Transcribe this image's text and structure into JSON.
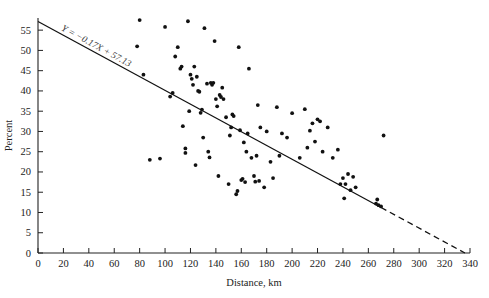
{
  "chart_data": {
    "type": "scatter",
    "title": "",
    "xlabel": "Distance, km",
    "ylabel": "Percent",
    "xlim": [
      0,
      340
    ],
    "ylim": [
      0,
      58
    ],
    "grid": false,
    "legend": null,
    "xticks": [
      0,
      20,
      40,
      60,
      80,
      100,
      120,
      140,
      160,
      180,
      200,
      220,
      240,
      260,
      280,
      300,
      320,
      340
    ],
    "yticks": [
      0,
      5,
      10,
      15,
      20,
      25,
      30,
      35,
      40,
      45,
      50,
      55
    ],
    "annotation": "Y = −0.17X + 57.13",
    "fit_line": {
      "slope": -0.17,
      "intercept": 57.13,
      "solid_range": [
        0,
        270
      ],
      "dashed_range": [
        270,
        336
      ]
    },
    "points": [
      [
        78,
        51.0
      ],
      [
        80,
        57.5
      ],
      [
        83,
        44.0
      ],
      [
        88,
        23.0
      ],
      [
        96,
        23.3
      ],
      [
        100,
        55.8
      ],
      [
        104,
        38.6
      ],
      [
        106,
        39.5
      ],
      [
        108,
        48.5
      ],
      [
        110,
        50.8
      ],
      [
        112,
        45.5
      ],
      [
        113,
        46.0
      ],
      [
        114,
        31.3
      ],
      [
        116,
        25.8
      ],
      [
        116,
        24.7
      ],
      [
        118,
        57.2
      ],
      [
        119,
        35.0
      ],
      [
        120,
        44.0
      ],
      [
        121,
        43.0
      ],
      [
        122,
        41.5
      ],
      [
        123,
        46.0
      ],
      [
        124,
        21.7
      ],
      [
        125,
        43.5
      ],
      [
        126,
        40.0
      ],
      [
        127,
        39.8
      ],
      [
        128,
        34.6
      ],
      [
        129,
        35.4
      ],
      [
        130,
        28.5
      ],
      [
        131,
        55.5
      ],
      [
        133,
        41.8
      ],
      [
        134,
        25.0
      ],
      [
        135,
        23.6
      ],
      [
        136,
        42.0
      ],
      [
        137,
        41.5
      ],
      [
        138,
        42.0
      ],
      [
        139,
        52.3
      ],
      [
        140,
        38.0
      ],
      [
        141,
        36.2
      ],
      [
        142,
        19.0
      ],
      [
        143,
        39.0
      ],
      [
        144,
        38.5
      ],
      [
        145,
        40.8
      ],
      [
        146,
        38.0
      ],
      [
        148,
        33.5
      ],
      [
        150,
        17.0
      ],
      [
        151,
        29.0
      ],
      [
        152,
        31.0
      ],
      [
        153,
        34.2
      ],
      [
        154,
        33.8
      ],
      [
        156,
        14.5
      ],
      [
        157,
        15.3
      ],
      [
        158,
        50.8
      ],
      [
        159,
        30.3
      ],
      [
        160,
        18.0
      ],
      [
        161,
        18.3
      ],
      [
        162,
        27.3
      ],
      [
        163,
        17.5
      ],
      [
        164,
        25.0
      ],
      [
        165,
        29.5
      ],
      [
        166,
        45.5
      ],
      [
        168,
        23.5
      ],
      [
        170,
        19.0
      ],
      [
        171,
        17.6
      ],
      [
        172,
        24.0
      ],
      [
        173,
        36.5
      ],
      [
        174,
        17.8
      ],
      [
        175,
        31.0
      ],
      [
        178,
        16.2
      ],
      [
        180,
        30.0
      ],
      [
        183,
        22.5
      ],
      [
        185,
        18.5
      ],
      [
        188,
        36.0
      ],
      [
        190,
        24.0
      ],
      [
        192,
        29.5
      ],
      [
        196,
        28.5
      ],
      [
        200,
        34.5
      ],
      [
        206,
        23.5
      ],
      [
        210,
        35.5
      ],
      [
        212,
        26.0
      ],
      [
        214,
        30.2
      ],
      [
        216,
        32.0
      ],
      [
        218,
        27.5
      ],
      [
        220,
        33.0
      ],
      [
        222,
        32.5
      ],
      [
        224,
        25.0
      ],
      [
        228,
        31.0
      ],
      [
        232,
        23.5
      ],
      [
        236,
        25.5
      ],
      [
        238,
        17.0
      ],
      [
        240,
        18.5
      ],
      [
        241,
        13.5
      ],
      [
        242,
        17.0
      ],
      [
        244,
        19.5
      ],
      [
        246,
        15.5
      ],
      [
        248,
        18.8
      ],
      [
        250,
        16.2
      ],
      [
        266,
        12.2
      ],
      [
        267,
        13.2
      ],
      [
        268,
        11.8
      ],
      [
        270,
        11.5
      ],
      [
        272,
        29.0
      ]
    ]
  }
}
